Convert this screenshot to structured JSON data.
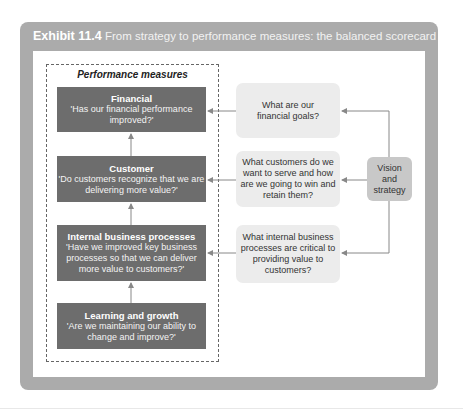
{
  "exhibit": {
    "label": "Exhibit 11.4",
    "title": " From strategy to performance measures: the balanced scorecard"
  },
  "performance_measures": {
    "title": "Performance measures",
    "boxes": [
      {
        "heading": "Financial",
        "question": "'Has our financial performance improved?'"
      },
      {
        "heading": "Customer",
        "question": "'Do customers recognize that we are delivering more value?'"
      },
      {
        "heading": "Internal business processes",
        "question": "'Have we improved key business processes so that we can deliver more value to customers?'"
      },
      {
        "heading": "Learning and growth",
        "question": "'Are we maintaining our ability to change and improve?'"
      }
    ]
  },
  "strategy_questions": [
    {
      "text": "What are our financial goals?"
    },
    {
      "text": "What customers do we want to serve and how are we going to win and retain them?"
    },
    {
      "text": "What internal business processes are critical to providing value to customers?"
    }
  ],
  "vision": {
    "text": "Vision and strategy"
  },
  "colors": {
    "frame": "#ababab",
    "dark_box": "#6d6d6d",
    "light_box": "#ececec",
    "vision_box": "#c8c8c8"
  }
}
